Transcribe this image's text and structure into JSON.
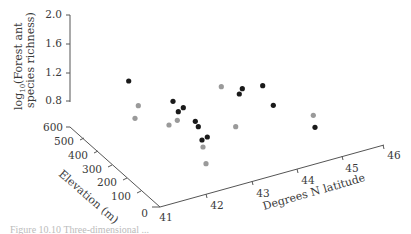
{
  "chart_data": {
    "type": "scatter",
    "projection": "3d",
    "title": "",
    "zlabel": "log10(Forest ant species richness)",
    "ylabel": "Elevation (m)",
    "xlabel": "Degrees N latitude",
    "z_ticks": [
      "2.0",
      "1.6",
      "1.2",
      "0.8"
    ],
    "elevation_ticks": [
      "600",
      "500",
      "400",
      "300",
      "200",
      "100",
      "0"
    ],
    "latitude_ticks": [
      "41",
      "42",
      "43",
      "44",
      "45",
      "46"
    ],
    "zlim": [
      0.6,
      2.0
    ],
    "elevation_lim": [
      0,
      600
    ],
    "latitude_lim": [
      41,
      46
    ],
    "grid": false,
    "legend": null,
    "series": [
      {
        "name": "species richness (dark points)",
        "color": "#1a1a1a",
        "screen_points": [
          [
            128.7,
            81
          ],
          [
            173,
            101.3
          ],
          [
            178.3,
            111.7
          ],
          [
            183.3,
            107.7
          ],
          [
            195.3,
            121.3
          ],
          [
            198.3,
            126.7
          ],
          [
            202,
            140
          ],
          [
            207.3,
            137
          ],
          [
            239.3,
            94
          ],
          [
            242.3,
            88.7
          ],
          [
            262.7,
            85.7
          ],
          [
            273.3,
            105.3
          ],
          [
            315,
            127.3
          ]
        ]
      },
      {
        "name": "projected points (gray shadows)",
        "color": "#9a9a9a",
        "screen_points": [
          [
            138.3,
            105.7
          ],
          [
            135,
            118.3
          ],
          [
            169,
            125
          ],
          [
            177.3,
            120.3
          ],
          [
            203,
            147
          ],
          [
            206,
            163.7
          ],
          [
            221.3,
            86.7
          ],
          [
            235.7,
            126.7
          ],
          [
            313.3,
            115.3
          ]
        ]
      }
    ]
  },
  "figure": {
    "caption": "Figure 10.10  Three-dimensional ..."
  }
}
